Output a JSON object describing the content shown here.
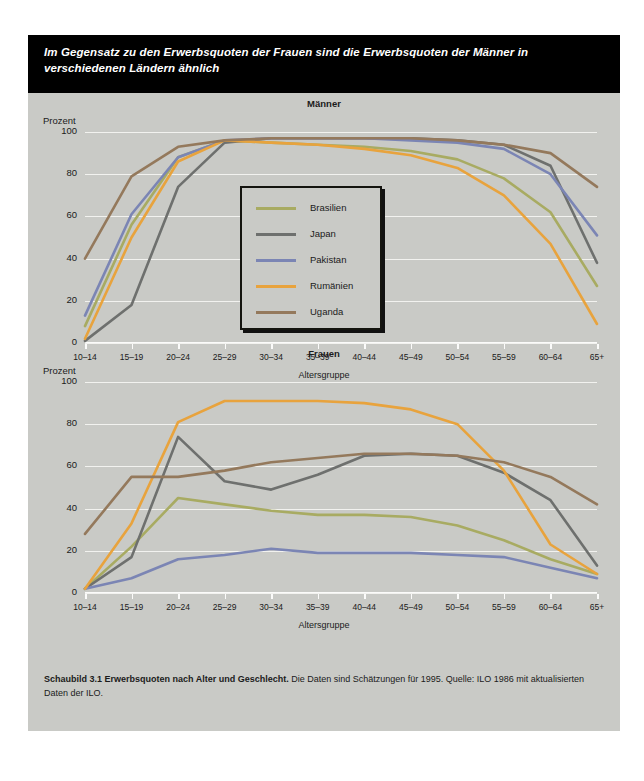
{
  "figure": {
    "headline": "Im Gegensatz zu den Erwerbsquoten der Frauen sind die Erwerbsquoten der Männer in verschiedenen Ländern ähnlich",
    "caption_bold": "Schaubild 3.1   Erwerbsquoten nach Alter und Geschlecht.",
    "caption_rest": " Die Daten sind Schätzungen für 1995. Quelle: ILO 1986 mit aktualisierten Daten der ILO."
  },
  "legend": {
    "position": "inside-upper-chart",
    "entries": [
      {
        "label": "Brasilien",
        "color": "#a8ab62"
      },
      {
        "label": "Japan",
        "color": "#6e706e"
      },
      {
        "label": "Pakistan",
        "color": "#7b85b4"
      },
      {
        "label": "Rumänien",
        "color": "#e8a33d"
      },
      {
        "label": "Uganda",
        "color": "#94795c"
      }
    ]
  },
  "chart_data": [
    {
      "type": "line",
      "title": "Männer",
      "xlabel": "Altersgruppe",
      "ylabel": "Prozent",
      "ylim": [
        0,
        100
      ],
      "yticks": [
        0,
        20,
        40,
        60,
        80,
        100
      ],
      "grid": true,
      "categories": [
        "10–14",
        "15–19",
        "20–24",
        "25–29",
        "30–34",
        "35–39",
        "40–44",
        "45–49",
        "50–54",
        "55–59",
        "60–64",
        "65+"
      ],
      "series": [
        {
          "name": "Brasilien",
          "color": "#a8ab62",
          "values": [
            8,
            56,
            88,
            96,
            95,
            94,
            93,
            91,
            87,
            78,
            62,
            27
          ]
        },
        {
          "name": "Japan",
          "color": "#6e706e",
          "values": [
            1,
            18,
            74,
            95,
            97,
            97,
            97,
            97,
            96,
            94,
            84,
            38
          ]
        },
        {
          "name": "Pakistan",
          "color": "#7b85b4",
          "values": [
            13,
            61,
            88,
            96,
            97,
            97,
            97,
            96,
            95,
            92,
            80,
            51
          ]
        },
        {
          "name": "Rumänien",
          "color": "#e8a33d",
          "values": [
            2,
            50,
            86,
            96,
            95,
            94,
            92,
            89,
            83,
            70,
            47,
            9
          ]
        },
        {
          "name": "Uganda",
          "color": "#94795c",
          "values": [
            40,
            79,
            93,
            96,
            97,
            97,
            97,
            97,
            96,
            94,
            90,
            74
          ]
        }
      ]
    },
    {
      "type": "line",
      "title": "Frauen",
      "xlabel": "Altersgruppe",
      "ylabel": "Prozent",
      "ylim": [
        0,
        100
      ],
      "yticks": [
        0,
        20,
        40,
        60,
        80,
        100
      ],
      "grid": true,
      "categories": [
        "10–14",
        "15–19",
        "20–24",
        "25–29",
        "30–34",
        "35–39",
        "40–44",
        "45–49",
        "50–54",
        "55–59",
        "60–64",
        "65+"
      ],
      "series": [
        {
          "name": "Brasilien",
          "color": "#a8ab62",
          "values": [
            2,
            22,
            45,
            42,
            39,
            37,
            37,
            36,
            32,
            25,
            16,
            9
          ]
        },
        {
          "name": "Japan",
          "color": "#6e706e",
          "values": [
            2,
            17,
            74,
            53,
            49,
            56,
            65,
            66,
            65,
            57,
            44,
            13
          ]
        },
        {
          "name": "Pakistan",
          "color": "#7b85b4",
          "values": [
            2,
            7,
            16,
            18,
            21,
            19,
            19,
            19,
            18,
            17,
            12,
            7
          ]
        },
        {
          "name": "Rumänien",
          "color": "#e8a33d",
          "values": [
            2,
            33,
            81,
            91,
            91,
            91,
            90,
            87,
            80,
            58,
            23,
            9
          ]
        },
        {
          "name": "Uganda",
          "color": "#94795c",
          "values": [
            28,
            55,
            55,
            58,
            62,
            64,
            66,
            66,
            65,
            62,
            55,
            42
          ]
        }
      ]
    }
  ]
}
